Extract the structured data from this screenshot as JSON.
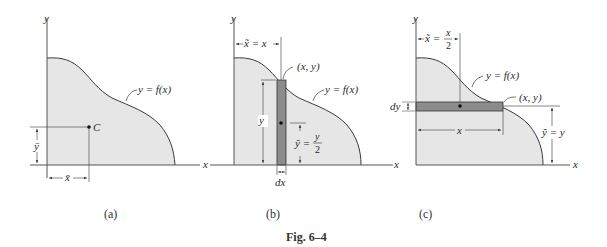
{
  "figure": {
    "caption": "Fig. 6–4",
    "colors": {
      "region_fill": "#e6e6e6",
      "strip_fill": "#8c8c8c",
      "line": "#3a3a3a",
      "axis": "#555555"
    },
    "panels": [
      {
        "id": "a",
        "label": "(a)",
        "axis_x": "x",
        "axis_y": "y",
        "curve_label": "y = f(x)",
        "centroid_label": "C",
        "xbar_label": "x̄",
        "ybar_label": "ȳ"
      },
      {
        "id": "b",
        "label": "(b)",
        "axis_x": "x",
        "axis_y": "y",
        "curve_label": "y = f(x)",
        "point_label": "(x, y)",
        "xtilde_label": "x̃ = x",
        "height_label": "y",
        "ytilde_lhs": "ỹ =",
        "ytilde_num": "y",
        "ytilde_den": "2",
        "width_label": "dx"
      },
      {
        "id": "c",
        "label": "(c)",
        "axis_x": "x",
        "axis_y": "y",
        "curve_label": "y = f(x)",
        "point_label": "(x, y)",
        "xtilde_lhs": "x̃ =",
        "xtilde_num": "x",
        "xtilde_den": "2",
        "length_label": "x",
        "ytilde_label": "ỹ = y",
        "thickness_label": "dy"
      }
    ]
  }
}
